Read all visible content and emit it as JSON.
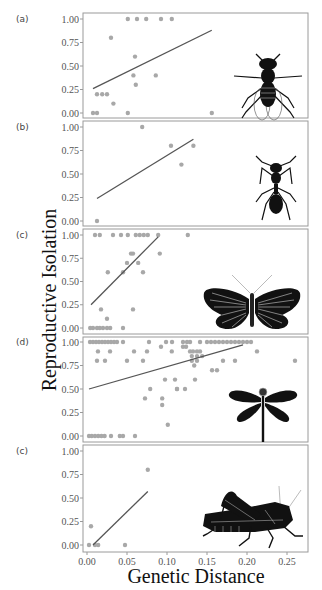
{
  "chart_data": [
    {
      "type": "scatter",
      "panel_label": "(a)",
      "organism": "fly",
      "xlabel": "Genetic Distance",
      "ylabel": "Reproductive Isolation",
      "xlim": [
        0.0,
        0.27
      ],
      "ylim": [
        0.0,
        1.0
      ],
      "yticks": [
        "0.00",
        "0.25",
        "0.50",
        "0.75",
        "1.00"
      ],
      "points": [
        [
          0.0075,
          0.0
        ],
        [
          0.0125,
          0.0
        ],
        [
          0.051,
          0.0
        ],
        [
          0.156,
          0.0
        ],
        [
          0.0125,
          0.2
        ],
        [
          0.019,
          0.2
        ],
        [
          0.025,
          0.2
        ],
        [
          0.033,
          0.1
        ],
        [
          0.061,
          0.3
        ],
        [
          0.058,
          0.4
        ],
        [
          0.086,
          0.4
        ],
        [
          0.06,
          0.6
        ],
        [
          0.03,
          0.8
        ],
        [
          0.051,
          1.0
        ],
        [
          0.0625,
          1.0
        ],
        [
          0.074,
          1.0
        ],
        [
          0.0925,
          1.0
        ],
        [
          0.106,
          1.0
        ]
      ],
      "fit_line": [
        [
          0.0075,
          0.26
        ],
        [
          0.156,
          0.88
        ]
      ]
    },
    {
      "type": "scatter",
      "panel_label": "(b)",
      "organism": "ant",
      "xlim": [
        0.0,
        0.27
      ],
      "ylim": [
        0.0,
        1.0
      ],
      "yticks": [
        "0.00",
        "0.25",
        "0.50",
        "0.75",
        "1.00"
      ],
      "points": [
        [
          0.0125,
          0.0
        ],
        [
          0.069,
          1.0
        ],
        [
          0.105,
          0.8
        ],
        [
          0.133,
          0.8
        ],
        [
          0.118,
          0.6
        ]
      ],
      "fit_line": [
        [
          0.0125,
          0.24
        ],
        [
          0.133,
          0.87
        ]
      ]
    },
    {
      "type": "scatter",
      "panel_label": "(c)",
      "organism": "butterfly",
      "xlim": [
        0.0,
        0.27
      ],
      "ylim": [
        0.0,
        1.0
      ],
      "yticks": [
        "0.00",
        "0.25",
        "0.50",
        "0.75",
        "1.00"
      ],
      "points": [
        [
          0.004,
          0.0
        ],
        [
          0.0075,
          0.0
        ],
        [
          0.0125,
          0.0
        ],
        [
          0.016,
          0.0
        ],
        [
          0.02,
          0.0
        ],
        [
          0.025,
          0.0
        ],
        [
          0.029,
          0.0
        ],
        [
          0.045,
          0.0
        ],
        [
          0.025,
          0.1
        ],
        [
          0.0175,
          0.2
        ],
        [
          0.0575,
          0.2
        ],
        [
          0.026,
          0.6
        ],
        [
          0.045,
          0.6
        ],
        [
          0.07,
          0.6
        ],
        [
          0.05,
          0.7
        ],
        [
          0.064,
          0.7
        ],
        [
          0.055,
          0.8
        ],
        [
          0.0575,
          0.8
        ],
        [
          0.091,
          0.8
        ],
        [
          0.01,
          1.0
        ],
        [
          0.016,
          1.0
        ],
        [
          0.0325,
          1.0
        ],
        [
          0.0425,
          1.0
        ],
        [
          0.051,
          1.0
        ],
        [
          0.061,
          1.0
        ],
        [
          0.066,
          1.0
        ],
        [
          0.071,
          1.0
        ],
        [
          0.076,
          1.0
        ],
        [
          0.089,
          1.0
        ],
        [
          0.126,
          1.0
        ]
      ],
      "fit_line": [
        [
          0.005,
          0.25
        ],
        [
          0.089,
          0.98
        ]
      ]
    },
    {
      "type": "scatter",
      "panel_label": "(d)",
      "organism": "dragonfly",
      "xlim": [
        0.0,
        0.27
      ],
      "ylim": [
        0.0,
        1.0
      ],
      "yticks": [
        "0.00",
        "0.25",
        "0.50",
        "0.75",
        "1.00"
      ],
      "points": [
        [
          0.0025,
          0.0
        ],
        [
          0.006,
          0.0
        ],
        [
          0.01,
          0.0
        ],
        [
          0.014,
          0.0
        ],
        [
          0.018,
          0.0
        ],
        [
          0.022,
          0.0
        ],
        [
          0.03,
          0.0
        ],
        [
          0.041,
          0.0
        ],
        [
          0.045,
          0.0
        ],
        [
          0.06,
          0.0
        ],
        [
          0.101,
          0.12
        ],
        [
          0.094,
          0.33
        ],
        [
          0.0725,
          0.4
        ],
        [
          0.094,
          0.4
        ],
        [
          0.079,
          0.5
        ],
        [
          0.1125,
          0.5
        ],
        [
          0.1125,
          0.5
        ],
        [
          0.1225,
          0.5
        ],
        [
          0.0975,
          0.6
        ],
        [
          0.11,
          0.6
        ],
        [
          0.135,
          0.6
        ],
        [
          0.1563,
          0.7
        ],
        [
          0.1625,
          0.7
        ],
        [
          0.134,
          0.75
        ],
        [
          0.0125,
          0.8
        ],
        [
          0.0225,
          0.8
        ],
        [
          0.05,
          0.8
        ],
        [
          0.07,
          0.8
        ],
        [
          0.131,
          0.8
        ],
        [
          0.1375,
          0.8
        ],
        [
          0.17,
          0.8
        ],
        [
          0.185,
          0.8
        ],
        [
          0.26,
          0.8
        ],
        [
          0.131,
          0.85
        ],
        [
          0.1375,
          0.85
        ],
        [
          0.144,
          0.85
        ],
        [
          0.0137,
          0.9
        ],
        [
          0.0288,
          0.9
        ],
        [
          0.0588,
          0.9
        ],
        [
          0.075,
          0.9
        ],
        [
          0.106,
          0.9
        ],
        [
          0.1288,
          0.9
        ],
        [
          0.1325,
          0.9
        ],
        [
          0.1375,
          0.9
        ],
        [
          0.1413,
          0.9
        ],
        [
          0.2125,
          0.9
        ],
        [
          0.0925,
          0.95
        ],
        [
          0.12,
          0.95
        ],
        [
          0.1238,
          0.95
        ],
        [
          0.0038,
          1.0
        ],
        [
          0.0075,
          1.0
        ],
        [
          0.0113,
          1.0
        ],
        [
          0.015,
          1.0
        ],
        [
          0.0188,
          1.0
        ],
        [
          0.0225,
          1.0
        ],
        [
          0.0263,
          1.0
        ],
        [
          0.03,
          1.0
        ],
        [
          0.0338,
          1.0
        ],
        [
          0.0375,
          1.0
        ],
        [
          0.045,
          1.0
        ],
        [
          0.0775,
          1.0
        ],
        [
          0.0988,
          1.0
        ],
        [
          0.1063,
          1.0
        ],
        [
          0.12,
          1.0
        ],
        [
          0.125,
          1.0
        ],
        [
          0.1288,
          1.0
        ],
        [
          0.1413,
          1.0
        ],
        [
          0.15,
          1.0
        ],
        [
          0.155,
          1.0
        ],
        [
          0.16,
          1.0
        ],
        [
          0.165,
          1.0
        ],
        [
          0.17,
          1.0
        ],
        [
          0.175,
          1.0
        ],
        [
          0.18,
          1.0
        ],
        [
          0.185,
          1.0
        ],
        [
          0.19,
          1.0
        ],
        [
          0.195,
          1.0
        ],
        [
          0.2,
          1.0
        ],
        [
          0.205,
          1.0
        ]
      ],
      "fit_line": [
        [
          0.0025,
          0.5
        ],
        [
          0.195,
          0.97
        ]
      ]
    },
    {
      "type": "scatter",
      "panel_label": "(c)",
      "organism": "grasshopper",
      "xlabel": "Genetic Distance",
      "xlim": [
        0.0,
        0.27
      ],
      "ylim": [
        0.0,
        1.0
      ],
      "xticks": [
        "0.00",
        "0.05",
        "0.10",
        "0.15",
        "0.20",
        "0.25"
      ],
      "yticks": [
        "0.00",
        "0.25",
        "0.50",
        "0.75",
        "1.00"
      ],
      "points": [
        [
          0.0025,
          0.0
        ],
        [
          0.01,
          0.0
        ],
        [
          0.014,
          0.0
        ],
        [
          0.0475,
          0.0
        ],
        [
          0.005,
          0.2
        ],
        [
          0.076,
          0.8
        ]
      ],
      "fit_line": [
        [
          0.0075,
          0.0
        ],
        [
          0.076,
          0.57
        ]
      ]
    }
  ],
  "axes": {
    "ylabel": "Reproductive Isolation",
    "xlabel": "Genetic Distance",
    "xticks": [
      "0.00",
      "0.05",
      "0.10",
      "0.15",
      "0.20",
      "0.25"
    ],
    "yticks": [
      "0.00",
      "0.25",
      "0.50",
      "0.75",
      "1.00"
    ]
  },
  "colors": {
    "point": "#a8a8a8",
    "line": "#555555",
    "frame": "#9a9a9a",
    "silhouette": "#111111"
  }
}
